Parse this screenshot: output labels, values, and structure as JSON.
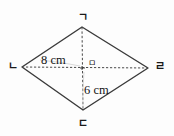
{
  "figure": {
    "type": "rhombus-with-diagonals",
    "vertices": {
      "top": "ㄱ",
      "left": "ㄴ",
      "bottom": "ㄷ",
      "right": "ㄹ",
      "center": "ㅁ"
    },
    "measurements": {
      "horizontal_half": "8 cm",
      "vertical_half": "6 cm"
    },
    "colors": {
      "outline": "#3a3a3a",
      "diagonal": "#555555",
      "background": "#fdfdfd",
      "text": "#1a1a1a"
    }
  }
}
